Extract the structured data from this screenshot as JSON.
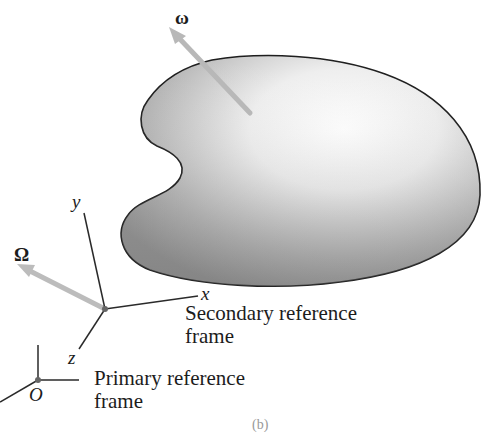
{
  "figure": {
    "vectors": {
      "omega": {
        "symbol": "ω",
        "meaning": "angular velocity of body",
        "color": "#b5b5b5"
      },
      "Omega": {
        "symbol": "Ω",
        "meaning": "angular velocity of secondary frame",
        "color": "#b5b5b5"
      }
    },
    "secondary_frame": {
      "axes": {
        "x": "x",
        "y": "y",
        "z": "z"
      },
      "caption_line1": "Secondary reference",
      "caption_line2": "frame"
    },
    "primary_frame": {
      "origin_label": "O",
      "caption_line1": "Primary reference",
      "caption_line2": "frame"
    },
    "subfigure_label": "(b)",
    "colors": {
      "body_fill_light": "#ffffff",
      "body_fill_dark": "#8f8f8f",
      "outline": "#1e1e1e",
      "arrow": "#b8b8b8"
    }
  }
}
